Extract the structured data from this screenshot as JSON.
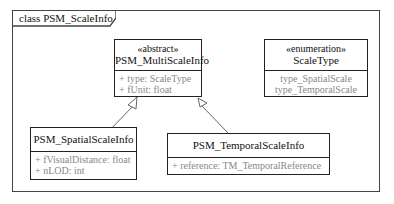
{
  "frame": {
    "title": "class PSM_ScaleInfo"
  },
  "classes": {
    "multi": {
      "stereotype": "«abstract»",
      "name": "PSM_MultiScaleInfo",
      "attributes": [
        "+ type: ScaleType",
        "+ fUnit: float"
      ]
    },
    "scaletype": {
      "stereotype": "«enumeration»",
      "name": "ScaleType",
      "literals": [
        "type_SpatialScale",
        "type_TemporalScale"
      ]
    },
    "spatial": {
      "name": "PSM_SpatialScaleInfo",
      "attributes": [
        "+ fVisualDistance: float",
        "+ nLOD: int"
      ]
    },
    "temporal": {
      "name": "PSM_TemporalScaleInfo",
      "attributes": [
        "+ reference: TM_TemporalReference"
      ]
    }
  },
  "relations": [
    {
      "type": "generalization",
      "from": "PSM_SpatialScaleInfo",
      "to": "PSM_MultiScaleInfo"
    },
    {
      "type": "generalization",
      "from": "PSM_TemporalScaleInfo",
      "to": "PSM_MultiScaleInfo"
    }
  ]
}
